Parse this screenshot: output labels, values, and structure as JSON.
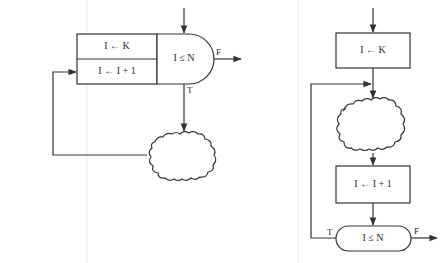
{
  "diagram": {
    "type": "flowchart-comparison",
    "colors": {
      "line": "#333333",
      "background": "#ffffff",
      "text": "#2a2a2a"
    },
    "left_flowchart": {
      "init_box": {
        "label": "I ← K"
      },
      "increment_box": {
        "label": "I ← I + 1"
      },
      "decision": {
        "label": "I ≤ N",
        "true_label": "T",
        "false_label": "F"
      },
      "body": {
        "shape": "cloud",
        "label": ""
      }
    },
    "right_flowchart": {
      "init_box": {
        "label": "I ← K"
      },
      "body": {
        "shape": "cloud",
        "label": ""
      },
      "increment_box": {
        "label": "I ← I + 1"
      },
      "decision": {
        "label": "I ≤ N",
        "true_label": "T",
        "false_label": "F"
      }
    }
  }
}
